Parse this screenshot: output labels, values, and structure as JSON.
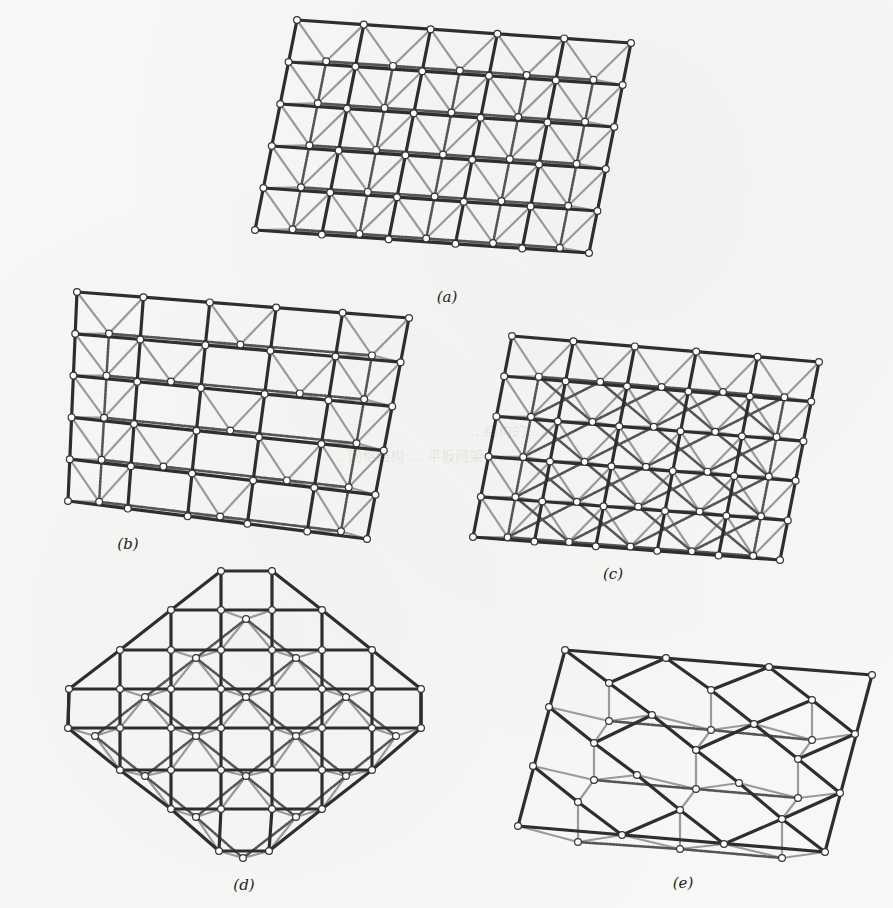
{
  "figure": {
    "panels": [
      {
        "id": "a",
        "label": "(a)",
        "caption_pos": [
          447,
          298
        ],
        "top_grid": {
          "corners": {
            "tl": [
              297,
              20
            ],
            "tr": [
              631,
              43
            ],
            "bl": [
              255,
              230
            ],
            "br": [
              589,
              253
            ]
          },
          "cols": 5,
          "rows": 5
        },
        "bottom_grid": {
          "corners": {
            "tl": [
              328,
              72
            ],
            "tr": [
              594,
              90
            ],
            "bl": [
              292,
              268
            ],
            "br": [
              559,
              268
            ]
          },
          "cols": 4,
          "rows": 5
        },
        "pattern": "full"
      },
      {
        "id": "b",
        "label": "(b)",
        "caption_pos": [
          128,
          545
        ],
        "top_grid": {
          "corners": {
            "tl": [
              77,
              292
            ],
            "tr": [
              409,
              318
            ],
            "bl": [
              68,
              501
            ],
            "br": [
              367,
              539
            ]
          },
          "cols": 5,
          "rows": 5
        },
        "bottom_grid": {
          "corners": {
            "tl": [
              106,
              350
            ],
            "tr": [
              373,
              373
            ],
            "bl": [
              72,
              526
            ],
            "br": [
              339,
              545
            ]
          },
          "cols": 4,
          "rows": 5
        },
        "pattern": "checker"
      },
      {
        "id": "c",
        "label": "(c)",
        "caption_pos": [
          613,
          575
        ],
        "top_grid": {
          "corners": {
            "tl": [
              512,
              336
            ],
            "tr": [
              819,
              362
            ],
            "bl": [
              473,
              537
            ],
            "br": [
              780,
              560
            ]
          },
          "cols": 5,
          "rows": 5
        },
        "bottom_grid": {
          "corners": {
            "tl": [
              539,
              390
            ],
            "tr": [
              785,
              410
            ],
            "bl": [
              508,
              553
            ],
            "br": [
              753,
              568
            ]
          },
          "cols": 4,
          "rows": 5
        },
        "pattern": "diagonal"
      },
      {
        "id": "d",
        "label": "(d)",
        "caption_pos": [
          244,
          886
        ],
        "shape": "octagon",
        "top_nodes_rows": [
          {
            "y": 571,
            "xs": [
              221,
              272
            ]
          },
          {
            "y": 610,
            "xs": [
              171,
              221,
              272,
              322
            ]
          },
          {
            "y": 650,
            "xs": [
              120,
              171,
              221,
              272,
              322,
              372
            ]
          },
          {
            "y": 689,
            "xs": [
              69,
              120,
              171,
              221,
              272,
              322,
              372,
              421
            ]
          },
          {
            "y": 728,
            "xs": [
              68,
              120,
              171,
              221,
              272,
              322,
              372,
              421
            ]
          },
          {
            "y": 770,
            "xs": [
              120,
              171,
              221,
              272,
              322,
              372
            ]
          },
          {
            "y": 809,
            "xs": [
              171,
              221,
              272,
              322
            ]
          },
          {
            "y": 851,
            "xs": [
              219,
              269
            ]
          }
        ],
        "bottom_nodes": [
          [
            246,
            619
          ],
          [
            196,
            658
          ],
          [
            296,
            658
          ],
          [
            145,
            697
          ],
          [
            246,
            697
          ],
          [
            346,
            697
          ],
          [
            95,
            736
          ],
          [
            196,
            736
          ],
          [
            296,
            736
          ],
          [
            396,
            736
          ],
          [
            145,
            776
          ],
          [
            246,
            776
          ],
          [
            346,
            776
          ],
          [
            196,
            817
          ],
          [
            296,
            817
          ],
          [
            243,
            858
          ]
        ]
      },
      {
        "id": "e",
        "label": "(e)",
        "caption_pos": [
          683,
          884
        ],
        "shape": "skew",
        "top_nodes": [
          [
            565,
            650
          ],
          [
            666,
            658
          ],
          [
            769,
            667
          ],
          [
            872,
            675
          ],
          [
            609,
            683
          ],
          [
            711,
            690
          ],
          [
            812,
            700
          ],
          [
            549,
            707
          ],
          [
            652,
            715
          ],
          [
            754,
            724
          ],
          [
            855,
            734
          ],
          [
            594,
            743
          ],
          [
            696,
            750
          ],
          [
            798,
            759
          ],
          [
            533,
            766
          ],
          [
            637,
            775
          ],
          [
            739,
            783
          ],
          [
            840,
            793
          ],
          [
            578,
            802
          ],
          [
            680,
            810
          ],
          [
            782,
            819
          ],
          [
            518,
            826
          ],
          [
            622,
            835
          ],
          [
            724,
            844
          ],
          [
            825,
            852
          ]
        ],
        "bottom_nodes": [
          [
            609,
            721
          ],
          [
            711,
            730
          ],
          [
            812,
            740
          ],
          [
            594,
            780
          ],
          [
            696,
            789
          ],
          [
            798,
            798
          ],
          [
            578,
            842
          ],
          [
            680,
            849
          ],
          [
            782,
            858
          ]
        ]
      }
    ],
    "colors": {
      "chord": "#2e2e2e",
      "web": "#9a9a9a",
      "bottom_chord": "#555555",
      "node_fill": "#ffffff",
      "node_stroke": "#333333"
    },
    "background_ghost_text": [
      "…结构的 …",
      "… 网格结构 … 平板网架 …"
    ]
  }
}
